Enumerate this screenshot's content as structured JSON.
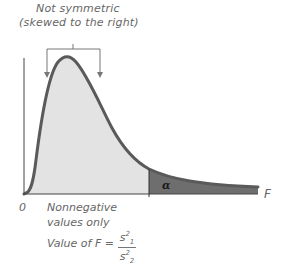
{
  "figure": {
    "annotation_line1": "Not symmetric",
    "annotation_line2": "(skewed to the right)",
    "origin_label": "0",
    "x_axis_label": "F",
    "nonnegative_line1": "Nonnegative",
    "nonnegative_line2": "values only",
    "value_of_f_label": "Value of F =",
    "fraction_numerator": "s",
    "numerator_sup": "2",
    "numerator_sub": "1",
    "fraction_denominator": "s",
    "denominator_sup": "2",
    "denominator_sub": "2",
    "tail_label": "α"
  },
  "colors": {
    "curve": "#5a5a5a",
    "body_fill": "#e3e3e3",
    "tail_fill": "#6e6e6e",
    "axis": "#333333",
    "text": "#666666"
  }
}
